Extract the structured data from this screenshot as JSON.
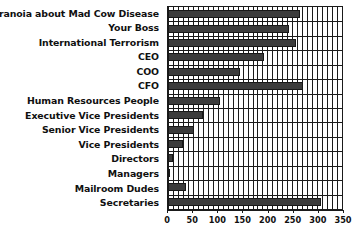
{
  "chart_data": {
    "type": "bar",
    "orientation": "horizontal",
    "title": "",
    "xlabel": "",
    "ylabel": "",
    "xlim": [
      0,
      350
    ],
    "grid": true,
    "legend": "none",
    "minor_gridline_step": 10,
    "tick_step": 50,
    "tick_labels": [
      "0",
      "50",
      "100",
      "150",
      "200",
      "250",
      "300",
      "350"
    ],
    "tick_values": [
      0,
      50,
      100,
      150,
      200,
      250,
      300,
      350
    ],
    "categories": [
      "Paranoia about Mad Cow Disease",
      "Your Boss",
      "International Terrorism",
      "CEO",
      "COO",
      "CFO",
      "Human Resources People",
      "Executive Vice Presidents",
      "Senior Vice Presidents",
      "Vice Presidents",
      "Directors",
      "Managers",
      "Mailroom Dudes",
      "Secretaries"
    ],
    "values": [
      266,
      243,
      257,
      193,
      144,
      272,
      104,
      70,
      52,
      31,
      11,
      3,
      37,
      307
    ],
    "bar_color": "#3b3b3b",
    "bar_edge_color": "#171717",
    "axis_color": "#1a1a1a",
    "background_color": "#ffffff"
  }
}
